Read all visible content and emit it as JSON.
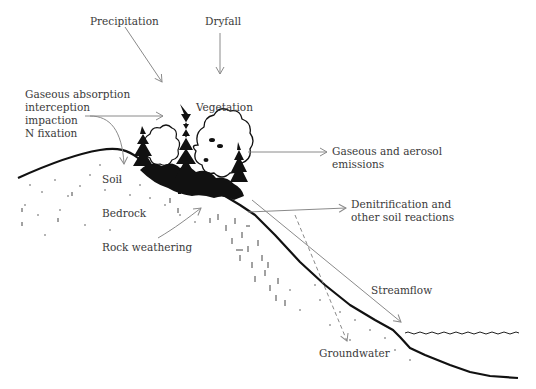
{
  "diagram": {
    "type": "watershed nitrogen cycle cross-section",
    "labels": {
      "precipitation": "Precipitation",
      "dryfall": "Dryfall",
      "gaseous_absorption": [
        "Gaseous absorption",
        "interception",
        "impaction",
        "N fixation"
      ],
      "vegetation": "Vegetation",
      "emissions": [
        "Gaseous and aerosol",
        "emissions"
      ],
      "soil": "Soil",
      "bedrock": "Bedrock",
      "rock_weathering": "Rock weathering",
      "denitrification": [
        "Denitrification and",
        "other soil reactions"
      ],
      "streamflow": "Streamflow",
      "groundwater": "Groundwater"
    },
    "colors": {
      "ink": "#111111",
      "arrow": "#8a8a8a",
      "text": "#3a3a3a",
      "background": "#ffffff"
    }
  }
}
